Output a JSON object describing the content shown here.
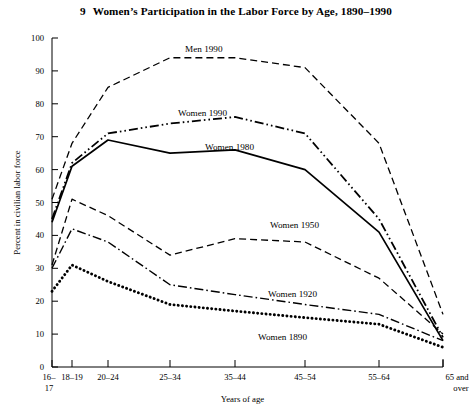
{
  "figure": {
    "number": "9",
    "title": "Women’s Participation in the Labor Force by Age, 1890–1990"
  },
  "axes": {
    "ylabel": "Percent in civilian labor force",
    "xlabel": "Years of age",
    "yticks": [
      "0",
      "10",
      "20",
      "30",
      "40",
      "50",
      "60",
      "70",
      "80",
      "90",
      "100"
    ],
    "xticklabels": [
      "16–17",
      "18–19",
      "20–24",
      "25–34",
      "35–44",
      "45–54",
      "55–64",
      "65 and over"
    ]
  },
  "chart_data": {
    "type": "line",
    "title": "Women’s Participation in the Labor Force by Age, 1890–1990",
    "xlabel": "Years of age",
    "ylabel": "Percent in civilian labor force",
    "categories": [
      "16–17",
      "18–19",
      "20–24",
      "25–34",
      "35–44",
      "45–54",
      "55–64",
      "65 and over"
    ],
    "ylim": [
      0,
      100
    ],
    "ytick_step": 10,
    "grid": false,
    "legend": "inline-annotations",
    "series": [
      {
        "name": "Men 1990",
        "style": "dashed",
        "color": "#000000",
        "values": [
          51,
          68,
          85,
          94,
          94,
          91,
          68,
          16
        ],
        "label_x_category": "25–34",
        "label_text": "Men 1990"
      },
      {
        "name": "Women 1990",
        "style": "dash-dot-dot",
        "color": "#000000",
        "values": [
          45,
          62,
          71,
          74,
          76,
          71,
          45,
          9
        ],
        "label_x_category": "25–34",
        "label_text": "Women 1990"
      },
      {
        "name": "Women 1980",
        "style": "solid",
        "color": "#000000",
        "values": [
          44,
          61,
          69,
          65,
          66,
          60,
          41,
          8
        ],
        "label_x_category": "25–34",
        "label_text": "Women 1980"
      },
      {
        "name": "Women 1950",
        "style": "dashed",
        "color": "#000000",
        "values": [
          31,
          51,
          46,
          34,
          39,
          38,
          27,
          10
        ],
        "label_x_category": "35–44",
        "label_text": "Women 1950"
      },
      {
        "name": "Women 1920",
        "style": "dash-dot",
        "color": "#000000",
        "values": [
          30,
          42,
          38,
          25,
          22,
          19,
          16,
          8
        ],
        "label_x_category": "35–44",
        "label_text": "Women 1920"
      },
      {
        "name": "Women 1890",
        "style": "dotted",
        "color": "#000000",
        "values": [
          23,
          31,
          26,
          19,
          17,
          15,
          13,
          6
        ],
        "label_x_category": "35–44",
        "label_text": "Women 1890"
      }
    ]
  },
  "series_labels": [
    {
      "text": "Men 1990",
      "x": 185,
      "y": 52
    },
    {
      "text": "Women 1990",
      "x": 178,
      "y": 116
    },
    {
      "text": "Women 1980",
      "x": 205,
      "y": 150
    },
    {
      "text": "Women 1950",
      "x": 270,
      "y": 228
    },
    {
      "text": "Women 1920",
      "x": 268,
      "y": 297
    },
    {
      "text": "Women 1890",
      "x": 258,
      "y": 340
    }
  ]
}
